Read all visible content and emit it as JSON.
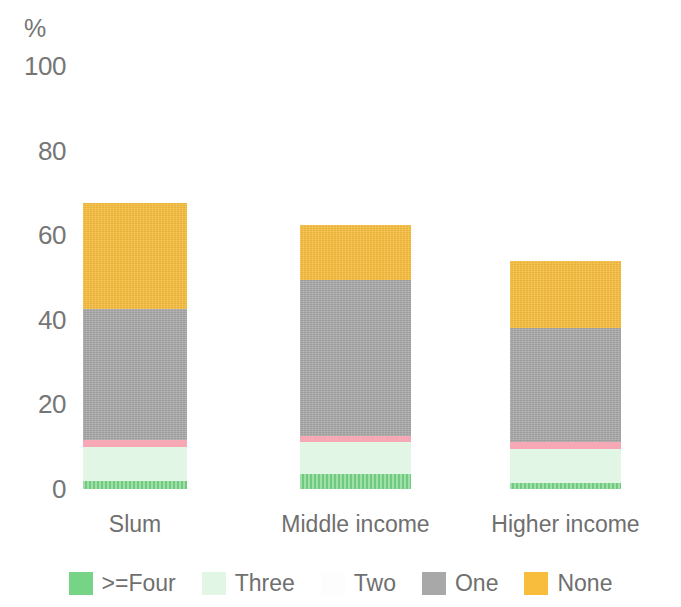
{
  "chart_data": {
    "type": "bar",
    "subtype": "stacked-bar-percent",
    "title": "",
    "xlabel": "",
    "ylabel": "%",
    "unit_label": "%",
    "ylim": [
      0,
      100
    ],
    "yticks": [
      0,
      20,
      40,
      60,
      80,
      100
    ],
    "ytick_labels": [
      "0",
      "20",
      "40",
      "60",
      "80",
      "100"
    ],
    "grid": false,
    "legend_position": "bottom",
    "categories": [
      "Slum",
      "Middle income",
      "Higher income"
    ],
    "series": [
      {
        "name": ">=Four",
        "color": "#77d487",
        "values": [
          2,
          3.5,
          1.5
        ]
      },
      {
        "name": "Three",
        "color": "#e2f6e6",
        "values": [
          8,
          7.5,
          8
        ]
      },
      {
        "name": "Two",
        "color": "#f6a9b4",
        "values": [
          1.5,
          1.5,
          1.5
        ]
      },
      {
        "name": "One",
        "color": "#a8a8a8",
        "values": [
          31,
          37,
          27
        ]
      },
      {
        "name": "None",
        "color": "#f8bd3c",
        "values": [
          25,
          13,
          16
        ]
      }
    ]
  },
  "axis": {
    "unit": "%",
    "ticks": [
      {
        "label": "100",
        "value": 100
      },
      {
        "label": "80",
        "value": 80
      },
      {
        "label": "60",
        "value": 60
      },
      {
        "label": "40",
        "value": 40
      },
      {
        "label": "20",
        "value": 20
      },
      {
        "label": "0",
        "value": 0
      }
    ]
  },
  "categories": [
    {
      "label": "Slum"
    },
    {
      "label": "Middle income"
    },
    {
      "label": "Higher income"
    }
  ],
  "legend": {
    "items": [
      {
        "label": ">=Four",
        "color": "#77d487"
      },
      {
        "label": "Three",
        "color": "#e2f6e6"
      },
      {
        "label": "Two",
        "color": "#fdfdfd"
      },
      {
        "label": "One",
        "color": "#a8a8a8"
      },
      {
        "label": "None",
        "color": "#f8bd3c"
      }
    ]
  },
  "colors": {
    "background": "#ffffff",
    "text": "#6f6f6f",
    "four": "#77d487",
    "three": "#e2f6e6",
    "two": "#f6a9b4",
    "one": "#a8a8a8",
    "none": "#f8bd3c"
  }
}
